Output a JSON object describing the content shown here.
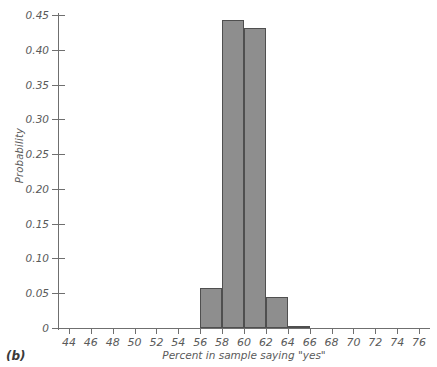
{
  "panel": {
    "label": "(b)"
  },
  "chart_data": {
    "type": "bar",
    "title": "",
    "xlabel": "Percent in sample saying \"yes\"",
    "ylabel": "Probability",
    "xlim": [
      43,
      77
    ],
    "ylim": [
      0,
      0.45
    ],
    "grid": false,
    "legend": "none",
    "bin_width": 2,
    "x_tick_labels": [
      "44",
      "46",
      "48",
      "50",
      "52",
      "54",
      "56",
      "58",
      "60",
      "62",
      "64",
      "66",
      "68",
      "70",
      "72",
      "74",
      "76"
    ],
    "x_tick_values": [
      44,
      46,
      48,
      50,
      52,
      54,
      56,
      58,
      60,
      62,
      64,
      66,
      68,
      70,
      72,
      74,
      76
    ],
    "y_tick_labels": [
      "0",
      "0.05",
      "0.10",
      "0.15",
      "0.20",
      "0.25",
      "0.30",
      "0.35",
      "0.40",
      "0.45"
    ],
    "y_tick_values": [
      0,
      0.05,
      0.1,
      0.15,
      0.2,
      0.25,
      0.3,
      0.35,
      0.4,
      0.45
    ],
    "bars": [
      {
        "bin_start": 56,
        "bin_end": 58,
        "value": 0.058
      },
      {
        "bin_start": 58,
        "bin_end": 60,
        "value": 0.443
      },
      {
        "bin_start": 60,
        "bin_end": 62,
        "value": 0.431
      },
      {
        "bin_start": 62,
        "bin_end": 64,
        "value": 0.044
      },
      {
        "bin_start": 64,
        "bin_end": 66,
        "value": 0.002
      }
    ],
    "categories": [
      "56-58",
      "58-60",
      "60-62",
      "62-64",
      "64-66"
    ],
    "values": [
      0.058,
      0.443,
      0.431,
      0.044,
      0.002
    ],
    "colors": {
      "bar_fill": "#8e8e8e",
      "bar_edge": "#4f4f4f",
      "axis": "#6f6f6f",
      "text": "#5a5a5a",
      "background": "#ffffff"
    }
  }
}
